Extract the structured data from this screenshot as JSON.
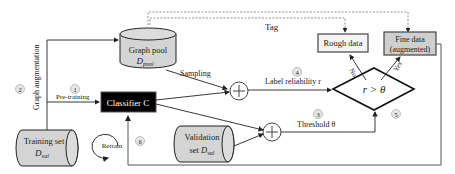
{
  "nodes": {
    "graph_pool": {
      "title": "Graph pool",
      "symbol": "D",
      "sub": "pool"
    },
    "training_set": {
      "title": "Training set",
      "symbol": "D",
      "sub": "val"
    },
    "validation_set": {
      "title": "Validation",
      "title2": "set",
      "symbol": "D",
      "sub": "val"
    },
    "classifier": {
      "title": "Classifier C"
    },
    "rough_data": {
      "title": "Rough data"
    },
    "fine_data": {
      "title": "Fine data",
      "title2": "(augmented)"
    },
    "decision": {
      "title": "r > θ"
    },
    "retrain": {
      "title": "Retrain"
    }
  },
  "edges": {
    "tag": "Tag",
    "sampling": "Sampling",
    "label_reliability": "Label reliability r",
    "threshold": "Threshold  θ",
    "pre_training": "Pre-training",
    "graph_augmentation": "Graph augmentation",
    "no": "No",
    "yes": "Yes"
  },
  "steps": [
    "1",
    "2",
    "3",
    "4",
    "5",
    "6"
  ],
  "colors": {
    "cylinder_fill": "#d4d4d4",
    "fine_fill": "#cfcfcf",
    "classifier_fill": "#000000",
    "badge_fill": "#e6e6e6",
    "line": "#222222"
  }
}
